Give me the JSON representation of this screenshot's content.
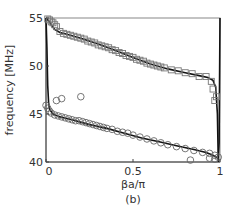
{
  "chart_data": {
    "type": "scatter",
    "title": "",
    "panel_label": "(b)",
    "xlabel": "βa/π",
    "ylabel": "frequency [MHz]",
    "xlim": [
      0,
      1
    ],
    "ylim": [
      40,
      55
    ],
    "xticks": [
      0,
      0.5,
      1
    ],
    "xtick_labels": [
      "0",
      "0.5",
      "1"
    ],
    "yticks": [
      40,
      45,
      50,
      55
    ],
    "ytick_labels": [
      "40",
      "45",
      "50",
      "55"
    ],
    "grid": false,
    "legend": null,
    "series": [
      {
        "name": "upper band measured",
        "marker": "square",
        "x": [
          0.01,
          0.02,
          0.03,
          0.04,
          0.05,
          0.06,
          0.08,
          0.1,
          0.12,
          0.14,
          0.16,
          0.18,
          0.2,
          0.22,
          0.24,
          0.26,
          0.28,
          0.3,
          0.32,
          0.34,
          0.36,
          0.38,
          0.4,
          0.42,
          0.44,
          0.46,
          0.48,
          0.5,
          0.52,
          0.54,
          0.56,
          0.58,
          0.6,
          0.62,
          0.64,
          0.66,
          0.68,
          0.72,
          0.76,
          0.8,
          0.84,
          0.88,
          0.92,
          0.95,
          0.96,
          0.97,
          0.98
        ],
        "y": [
          54.9,
          54.8,
          54.6,
          54.5,
          54.3,
          54.1,
          53.6,
          53.4,
          53.3,
          53.2,
          53.1,
          53.0,
          52.9,
          52.8,
          52.6,
          52.5,
          52.4,
          52.2,
          52.1,
          52.0,
          51.9,
          51.7,
          51.6,
          51.4,
          51.3,
          51.1,
          51.0,
          50.9,
          50.7,
          50.6,
          50.5,
          50.3,
          50.2,
          50.1,
          50.0,
          49.9,
          49.8,
          49.6,
          49.5,
          49.3,
          49.2,
          48.9,
          48.9,
          48.4,
          47.6,
          46.4,
          46.8
        ]
      },
      {
        "name": "lower band measured",
        "marker": "circle",
        "x": [
          0.0,
          0.01,
          0.02,
          0.03,
          0.05,
          0.07,
          0.09,
          0.11,
          0.13,
          0.15,
          0.17,
          0.19,
          0.21,
          0.23,
          0.25,
          0.27,
          0.29,
          0.31,
          0.33,
          0.35,
          0.38,
          0.41,
          0.44,
          0.47,
          0.5,
          0.54,
          0.58,
          0.62,
          0.66,
          0.7,
          0.75,
          0.8,
          0.85,
          0.9,
          0.94,
          0.97,
          0.99,
          0.06,
          0.09,
          0.2,
          0.83,
          0.94,
          0.97
        ],
        "y": [
          45.9,
          45.6,
          45.3,
          45.1,
          44.9,
          44.8,
          44.7,
          44.6,
          44.5,
          44.4,
          44.3,
          44.3,
          44.2,
          44.1,
          44.0,
          43.9,
          43.8,
          43.7,
          43.6,
          43.5,
          43.4,
          43.2,
          43.1,
          43.0,
          42.8,
          42.6,
          42.4,
          42.2,
          42.0,
          41.8,
          41.6,
          41.4,
          41.2,
          41.0,
          40.9,
          40.7,
          40.5,
          46.4,
          46.6,
          46.8,
          40.2,
          40.4,
          40.3
        ]
      },
      {
        "name": "upper band theory",
        "line": "solid",
        "x": [
          0.0,
          0.005,
          0.01,
          0.02,
          0.03,
          0.05,
          0.08,
          0.12,
          0.2,
          0.3,
          0.4,
          0.5,
          0.6,
          0.7,
          0.8,
          0.88,
          0.93,
          0.96,
          0.975,
          0.985,
          0.99
        ],
        "y": [
          55.0,
          54.9,
          54.8,
          54.6,
          54.3,
          53.8,
          53.5,
          53.3,
          52.9,
          52.3,
          51.6,
          50.9,
          50.2,
          49.7,
          49.3,
          49.0,
          48.8,
          48.5,
          47.8,
          45.0,
          40.0
        ]
      },
      {
        "name": "lower band theory",
        "line": "solid",
        "x": [
          0.0,
          0.005,
          0.01,
          0.015,
          0.02,
          0.04,
          0.08,
          0.15,
          0.25,
          0.35,
          0.45,
          0.55,
          0.65,
          0.75,
          0.85,
          0.92,
          0.96,
          0.98,
          0.99,
          0.995,
          1.0
        ],
        "y": [
          55.0,
          52.0,
          48.0,
          46.2,
          45.5,
          45.0,
          44.7,
          44.4,
          43.9,
          43.5,
          43.0,
          42.5,
          42.1,
          41.7,
          41.3,
          41.0,
          40.7,
          40.5,
          40.4,
          42.0,
          55.0
        ]
      }
    ]
  }
}
